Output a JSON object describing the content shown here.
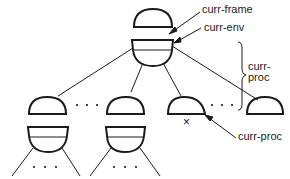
{
  "diagram": {
    "type": "environment-tree",
    "labels": {
      "curr_frame": "curr-frame",
      "curr_env": "curr-env",
      "curr_proc_brace_line1": "curr-",
      "curr_proc_brace_line2": "proc",
      "curr_proc_pointer": "curr-proc",
      "marker": "×",
      "ellipsis": ". . ."
    },
    "nodes": [
      {
        "id": "root-frame",
        "kind": "frame",
        "note": "pointed to by curr-frame"
      },
      {
        "id": "root-env",
        "kind": "env",
        "note": "pointed to by curr-env"
      },
      {
        "id": "child-1",
        "kind": "frame+env"
      },
      {
        "id": "child-2",
        "kind": "frame+env"
      },
      {
        "id": "child-3",
        "kind": "frame",
        "note": "marked ×, pointed to by curr-proc"
      },
      {
        "id": "child-4",
        "kind": "frame"
      }
    ],
    "colors": {
      "stroke": "#1a1a1a",
      "background": "#ffffff"
    }
  }
}
